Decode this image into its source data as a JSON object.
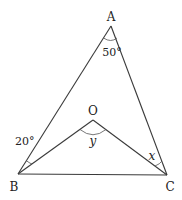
{
  "diagram": {
    "type": "triangle-geometry",
    "points": {
      "A": {
        "label": "A",
        "x": 111,
        "y": 26
      },
      "B": {
        "label": "B",
        "x": 18,
        "y": 174
      },
      "C": {
        "label": "C",
        "x": 167,
        "y": 175
      },
      "O": {
        "label": "O",
        "x": 93,
        "y": 120
      }
    },
    "segments": [
      "AB",
      "AC",
      "BC",
      "OB",
      "OC"
    ],
    "angle_labels": {
      "A": "50°",
      "ABO": "20°",
      "BOC": "y",
      "OCA": "x"
    }
  }
}
